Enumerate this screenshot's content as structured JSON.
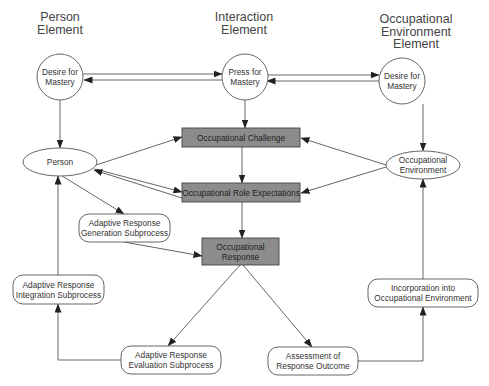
{
  "headers": {
    "person": [
      "Person",
      "Element"
    ],
    "interaction": [
      "Interaction",
      "Element"
    ],
    "environment": [
      "Occupational",
      "Environment",
      "Element"
    ]
  },
  "nodes": {
    "desire_person": [
      "Desire for",
      "Mastery"
    ],
    "press": [
      "Press for",
      "Mastery"
    ],
    "desire_env": [
      "Desire for",
      "Mastery"
    ],
    "challenge": [
      "Occupational Challenge"
    ],
    "role_expectations": [
      "Occupational Role Expectations"
    ],
    "response": [
      "Occupational",
      "Response"
    ],
    "person": [
      "Person"
    ],
    "environment": [
      "Occupational",
      "Environment"
    ],
    "generation": [
      "Adaptive Response",
      "Generation Subprocess"
    ],
    "integration": [
      "Adaptive Response",
      "Integration Subprocess"
    ],
    "evaluation": [
      "Adaptive Response",
      "Evaluation Subprocess"
    ],
    "assessment": [
      "Assessment of",
      "Response Outcome"
    ],
    "incorporation": [
      "Incorporation into",
      "Occupational Environment"
    ]
  },
  "colors": {
    "gray_box_fill": "#8c8c8c",
    "line": "#555555",
    "node_border": "#555555"
  }
}
